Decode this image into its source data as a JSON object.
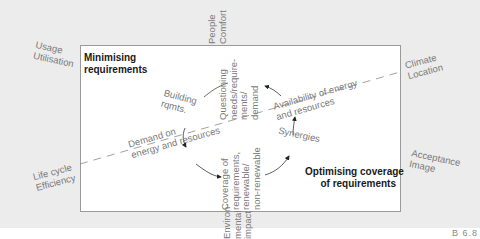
{
  "diagram": {
    "colors": {
      "background": "#ececec",
      "box": "#ffffff",
      "border": "#9a9a9a",
      "label": "#7a7a7a",
      "heading": "#1a1a1a"
    },
    "box_headings": {
      "top_left": "Minimising\nrequirements",
      "bottom_right": "Optimising coverage\nof requirements"
    },
    "outer_labels": {
      "top_left": "Usage\nUtilisation",
      "top_center": "People\nComfort",
      "right_top": "Climate\nLocation",
      "left_bottom": "Life cycle\nEfficiency",
      "right_bottom": "Acceptance\nImage",
      "bottom_center": "Environ-\nmental\nimpact"
    },
    "inner_labels": {
      "building": "Building\nrqmts.",
      "questioning": "Questioning\nneeds/require-\nments/\ndemand",
      "availability": "Availability of energy\nand resources",
      "demand": "Demand on\nenergy and resources",
      "coverage": "Coverage of\nrequirements,\nrenewable/\nnon-renewable",
      "synergies": "Synergies"
    },
    "figure_number": "B 6.8"
  }
}
